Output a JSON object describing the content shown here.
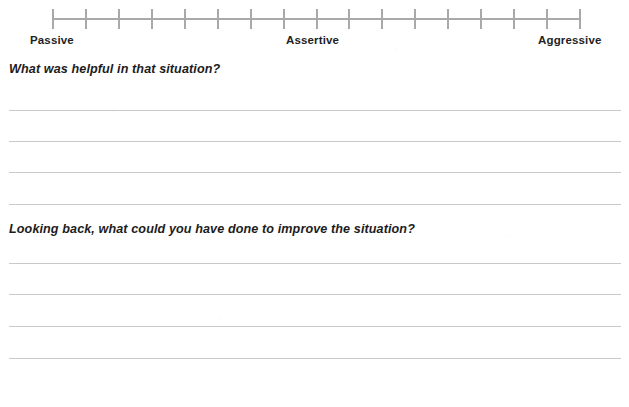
{
  "document": {
    "type": "worksheet",
    "background_color": "#ffffff",
    "text_color": "#1c1c1c"
  },
  "scale": {
    "name": "assertiveness-scale",
    "line_color": "#a9a9a9",
    "tick_count": 17,
    "interval_count": 16,
    "axis_left_px": 53,
    "axis_width_px": 527,
    "labels": {
      "left": "Passive",
      "middle": "Assertive",
      "right": "Aggressive"
    }
  },
  "sections": [
    {
      "name": "helpful-section",
      "question": "What was helpful in that situation?",
      "answer_value": "",
      "answer_placeholder": "",
      "line_count": 4,
      "line_y": [
        110,
        141,
        172,
        204
      ]
    },
    {
      "name": "improve-section",
      "question": "Looking back, what could you have done to improve the situation?",
      "answer_value": "",
      "answer_placeholder": "",
      "line_count": 4,
      "line_y": [
        263,
        294,
        326,
        358
      ]
    }
  ],
  "rule_line": {
    "color": "#c9c9c9",
    "left_px": 9,
    "width_px": 612
  }
}
